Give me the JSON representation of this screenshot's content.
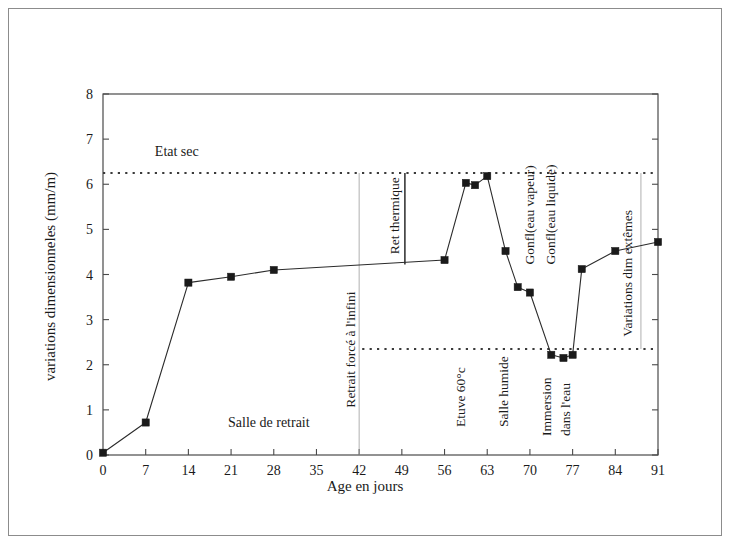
{
  "figure": {
    "background_color": "#ffffff",
    "border_color": "#8c8c8c",
    "line_color": "#2b2b2b",
    "marker_color": "#1a1a1a",
    "guide_color": "#3a3a3a"
  },
  "chart_data": {
    "type": "line",
    "title": "",
    "xlabel": "Age en jours",
    "ylabel": "variations dimensionneles (mm/m)",
    "xlim": [
      0,
      91
    ],
    "ylim": [
      0,
      8
    ],
    "xticks": [
      0,
      7,
      14,
      21,
      28,
      35,
      42,
      49,
      56,
      63,
      70,
      77,
      84,
      91
    ],
    "yticks": [
      0,
      1,
      2,
      3,
      4,
      5,
      6,
      7,
      8
    ],
    "xticklabels": [
      "0",
      "7",
      "14",
      "21",
      "28",
      "35",
      "42",
      "49",
      "56",
      "63",
      "70",
      "77",
      "84",
      "91"
    ],
    "yticklabels": [
      "0",
      "1",
      "2",
      "3",
      "4",
      "5",
      "6",
      "7",
      "8"
    ],
    "grid": false,
    "legend": false,
    "series": [
      {
        "name": "variations dimensionneles",
        "marker": "square",
        "x": [
          0,
          7,
          14,
          21,
          28,
          56,
          59.5,
          61,
          63,
          66,
          68,
          70,
          73.5,
          75.5,
          77,
          78.5,
          84,
          91
        ],
        "values": [
          0.05,
          0.72,
          3.82,
          3.95,
          4.1,
          4.32,
          6.03,
          5.98,
          6.18,
          4.52,
          3.72,
          3.6,
          2.22,
          2.15,
          2.22,
          4.12,
          4.52,
          4.72
        ]
      }
    ],
    "reference_lines": [
      {
        "name": "etat-sec-line",
        "y": 6.25,
        "style": "dotted",
        "x_from": 0,
        "x_to": 91
      },
      {
        "name": "lower-limit-line",
        "y": 2.35,
        "style": "dotted",
        "x_from": 42.5,
        "x_to": 91
      }
    ],
    "vertical_markers": [
      {
        "name": "retrait-force-line",
        "x": 42,
        "y_from": 0,
        "y_to": 6.25,
        "style": "thin-solid"
      },
      {
        "name": "ret-thermique-bracket",
        "x": 49.5,
        "y_from": 4.22,
        "y_to": 6.25,
        "style": "solid"
      },
      {
        "name": "variations-extremes-bracket",
        "x": 88.2,
        "y_from": 2.35,
        "y_to": 6.25,
        "style": "thin-solid"
      }
    ],
    "annotations": [
      {
        "name": "etat-sec",
        "text": "Etat sec",
        "x": 8.5,
        "y": 6.62,
        "orientation": "horizontal"
      },
      {
        "name": "salle-de-retrait",
        "text": "Salle de retrait",
        "x": 20.5,
        "y": 0.62,
        "orientation": "horizontal"
      },
      {
        "name": "retrait-force-a-linfini",
        "text": "Retrait forcé à l'infini",
        "x": 41.4,
        "y": 1.05,
        "orientation": "vertical"
      },
      {
        "name": "ret-thermique",
        "text": "Ret thermique",
        "x": 48.6,
        "y": 4.45,
        "orientation": "vertical"
      },
      {
        "name": "etuve-60c",
        "text": "Etuve 60°c",
        "x": 59.3,
        "y": 0.62,
        "orientation": "vertical"
      },
      {
        "name": "salle-humide",
        "text": "Salle humide",
        "x": 66.4,
        "y": 0.62,
        "orientation": "vertical"
      },
      {
        "name": "gonfl-eau-vapeur",
        "text": "Gonfl(eau vapeur)",
        "x": 70.6,
        "y": 4.22,
        "orientation": "vertical"
      },
      {
        "name": "gonfl-eau-liquide",
        "text": "Gonfl(eau liquide)",
        "x": 74.1,
        "y": 4.22,
        "orientation": "vertical"
      },
      {
        "name": "immersion-dans-leau-1",
        "text": "Immersion",
        "x": 73.5,
        "y": 0.42,
        "orientation": "vertical"
      },
      {
        "name": "immersion-dans-leau-2",
        "text": "dans l'eau",
        "x": 76.6,
        "y": 0.42,
        "orientation": "vertical"
      },
      {
        "name": "variations-dim-extremes",
        "text": "Variations dim extêmes",
        "x": 86.7,
        "y": 2.62,
        "orientation": "vertical"
      }
    ]
  }
}
